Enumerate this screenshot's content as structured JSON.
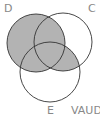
{
  "diagram": {
    "type": "venn",
    "sets": [
      {
        "id": "D",
        "label": "D",
        "cx": 36,
        "cy": 43,
        "r": 29
      },
      {
        "id": "C",
        "label": "C",
        "cx": 63,
        "cy": 42,
        "r": 29
      },
      {
        "id": "E",
        "label": "E",
        "cx": 50,
        "cy": 72,
        "r": 30
      }
    ],
    "shaded_region": "D ∪ (C ∩ E)",
    "fill_color": "#b3b3b3",
    "stroke_color": "#333333",
    "caption": "VAUD"
  }
}
